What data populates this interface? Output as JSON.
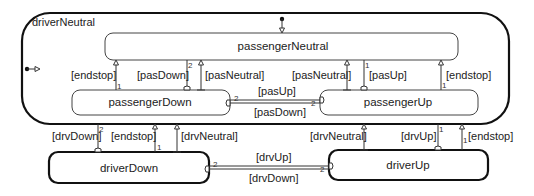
{
  "diagram": {
    "type": "statechart",
    "states": {
      "driverNeutral": {
        "label": "driverNeutral"
      },
      "passengerNeutral": {
        "label": "passengerNeutral"
      },
      "passengerDown": {
        "label": "passengerDown"
      },
      "passengerUp": {
        "label": "passengerUp"
      },
      "driverDown": {
        "label": "driverDown"
      },
      "driverUp": {
        "label": "driverUp"
      }
    },
    "transitions": {
      "pd_to_pn_endstop": {
        "guard": "[endstop]",
        "priority": "1"
      },
      "pn_to_pd_pasDown": {
        "guard": "[pasDown]",
        "priority": "2"
      },
      "pd_to_pn_pasNeutral": {
        "guard": "[pasNeutral]"
      },
      "pu_to_pn_pasNeutral": {
        "guard": "[pasNeutral]"
      },
      "pn_to_pu_pasUp": {
        "guard": "[pasUp]",
        "priority": "1"
      },
      "pu_to_pn_endstop": {
        "guard": "[endstop]",
        "priority": "1"
      },
      "pd_to_pu_pasUp": {
        "guard": "[pasUp]",
        "priority": "2"
      },
      "pu_to_pd_pasDown": {
        "guard": "[pasDown]",
        "priority": "2"
      },
      "dn_to_dd_drvDown": {
        "guard": "[drvDown]",
        "priority": "2"
      },
      "dd_to_dn_endstop": {
        "guard": "[endstop]",
        "priority": "1"
      },
      "dd_to_dn_drvNeutral": {
        "guard": "[drvNeutral]"
      },
      "du_to_dn_drvNeutral": {
        "guard": "[drvNeutral]"
      },
      "dn_to_du_drvUp": {
        "guard": "[drvUp]",
        "priority": "1"
      },
      "du_to_dn_endstop": {
        "guard": "[endstop]",
        "priority": "1"
      },
      "dd_to_du_drvUp": {
        "guard": "[drvUp]",
        "priority": "2"
      },
      "du_to_dd_drvDown": {
        "guard": "[drvDown]",
        "priority": "2"
      }
    }
  }
}
